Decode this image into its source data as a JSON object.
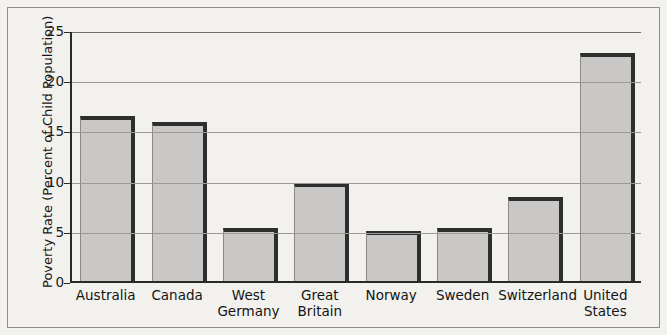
{
  "chart_data": {
    "type": "bar",
    "title": "",
    "subtitle": "",
    "xlabel": "",
    "ylabel": "Poverty Rate (Percent of Child Population)",
    "ylim": [
      0,
      25
    ],
    "ytick_values": [
      0,
      5,
      10,
      15,
      20,
      25
    ],
    "ytick_labels": [
      "0",
      "5",
      "10",
      "15",
      "20",
      "25"
    ],
    "grid": "horizontal",
    "legend": "none",
    "categories": [
      "Australia",
      "West Germany",
      "Great Britain",
      "Norway",
      "Sweden",
      "Switzerland",
      "United States",
      "Canada"
    ],
    "bars": [
      {
        "label_lines": [
          "Australia"
        ],
        "value": 16.4
      },
      {
        "label_lines": [
          "Canada"
        ],
        "value": 15.8
      },
      {
        "label_lines": [
          "West",
          "Germany"
        ],
        "value": 5.3
      },
      {
        "label_lines": [
          "Great",
          "Britain"
        ],
        "value": 9.8
      },
      {
        "label_lines": [
          "Norway"
        ],
        "value": 5.0
      },
      {
        "label_lines": [
          "Sweden"
        ],
        "value": 5.3
      },
      {
        "label_lines": [
          "Switzerland"
        ],
        "value": 8.4
      },
      {
        "label_lines": [
          "United",
          "States"
        ],
        "value": 22.7
      }
    ],
    "values": [
      16.4,
      15.8,
      5.3,
      9.8,
      5.0,
      5.3,
      8.4,
      22.7
    ],
    "colors": {
      "bar_fill": "#c9c8c6",
      "bar_edge": "#2e2e2e",
      "gridline": "#9b9a96",
      "axis": "#2a2a2a",
      "background": "#f2f1ee",
      "frame": "#8e8d89",
      "text": "#141414"
    }
  }
}
